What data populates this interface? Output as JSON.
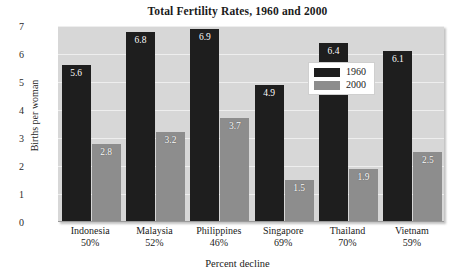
{
  "chart_data": {
    "type": "bar",
    "title": "Total Fertility Rates, 1960 and 2000",
    "xlabel": "Percent decline",
    "ylabel": "Births per woman",
    "ylim": [
      0,
      7
    ],
    "yticks": [
      7,
      6,
      5,
      4,
      3,
      2,
      1,
      0
    ],
    "grid": true,
    "legend_position": "inside-top-center",
    "categories": [
      "Indonesia",
      "Malaysia",
      "Philippines",
      "Singapore",
      "Thailand",
      "Vietnam"
    ],
    "category_sublabels": [
      "50%",
      "52%",
      "46%",
      "69%",
      "70%",
      "59%"
    ],
    "series": [
      {
        "name": "1960",
        "color": "#1e1e1e",
        "values": [
          5.6,
          6.8,
          6.9,
          4.9,
          6.4,
          6.1
        ]
      },
      {
        "name": "2000",
        "color": "#8d8d8d",
        "values": [
          2.8,
          3.2,
          3.7,
          1.5,
          1.9,
          2.5
        ]
      }
    ]
  },
  "legend": {
    "items": [
      {
        "label": "1960"
      },
      {
        "label": "2000"
      }
    ]
  }
}
